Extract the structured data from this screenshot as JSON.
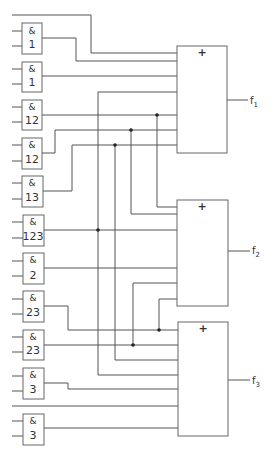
{
  "diagram": {
    "type": "logic-circuit",
    "and_gates": [
      {
        "op": "&",
        "label": "1"
      },
      {
        "op": "&",
        "label": "1"
      },
      {
        "op": "&",
        "label": "12"
      },
      {
        "op": "&",
        "label": "12"
      },
      {
        "op": "&",
        "label": "13"
      },
      {
        "op": "&",
        "label": "123"
      },
      {
        "op": "&",
        "label": "2"
      },
      {
        "op": "&",
        "label": "23"
      },
      {
        "op": "&",
        "label": "23"
      },
      {
        "op": "&",
        "label": "3"
      },
      {
        "op": "&",
        "label": "3"
      }
    ],
    "or_gates": [
      {
        "op": "+",
        "output": "f",
        "sub": "1"
      },
      {
        "op": "+",
        "output": "f",
        "sub": "2"
      },
      {
        "op": "+",
        "output": "f",
        "sub": "3"
      }
    ],
    "colors": {
      "line": "#555555",
      "background": "#ffffff"
    }
  }
}
